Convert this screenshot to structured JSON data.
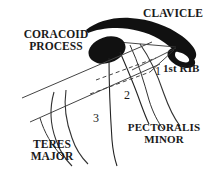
{
  "figure": {
    "background": "#ffffff",
    "ink_color": "#111111",
    "line_color": "#333333",
    "width": 220,
    "height": 176
  },
  "labels": {
    "clavicle": "CLAVICLE",
    "coracoid_process": "CORACOID\nPROCESS",
    "first_rib": "1st RIB",
    "pectoralis_minor": "PECTORALIS\nMINOR",
    "teres_major": "TERES\nMAJOR"
  },
  "markers": {
    "one": "1",
    "two": "2",
    "three": "3"
  },
  "structures": [
    {
      "name": "clavicle",
      "style": "solid-filled-black",
      "description": "thick curved bone across top with hooked medial end"
    },
    {
      "name": "coracoid-process",
      "style": "solid-filled-black",
      "description": "black oval blob below clavicle"
    },
    {
      "name": "first-rib",
      "style": "thin-curve",
      "description": "curve sweeping from under clavicle down to the right"
    },
    {
      "name": "pectoralis-minor",
      "style": "thin-lines",
      "description": "two long lines descending from coracoid process"
    },
    {
      "name": "teres-major",
      "style": "thin-curves",
      "description": "curved lines at lower left"
    },
    {
      "name": "axillary-artery-band",
      "style": "parallel-diagonal-lines",
      "description": "band running lower-left to upper-right"
    },
    {
      "name": "division-line-1",
      "style": "dashed",
      "description": "upper dashed division line"
    },
    {
      "name": "division-line-2",
      "style": "dashed",
      "description": "lower dashed division line"
    }
  ]
}
